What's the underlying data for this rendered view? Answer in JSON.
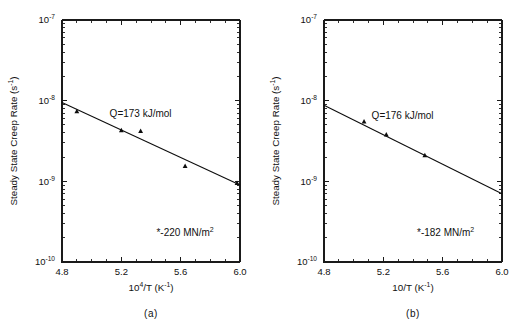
{
  "figure": {
    "panel_a_caption": "(a)",
    "panel_b_caption": "(b)"
  },
  "chart_data": [
    {
      "type": "scatter",
      "panel": "a",
      "caption": "(a)",
      "title": "",
      "xlabel_parts": {
        "base": "10",
        "exp": "4",
        "rest": "/T  (K",
        "rest_exp": "-1",
        "tail": ")"
      },
      "xlabel": "10^4/T (K^-1)",
      "ylabel": "Steady State Creep Rate (s^-1)",
      "ylabel_parts": {
        "text": "Steady State Creep Rate  (s",
        "exp": "-1",
        "tail": ")"
      },
      "xlim": [
        4.8,
        6.0
      ],
      "ylim": [
        1e-10,
        1e-07
      ],
      "yscale": "log",
      "xticks": [
        4.8,
        5.2,
        5.6,
        6.0
      ],
      "xticklabels": [
        "4.8",
        "5.2",
        "5.6",
        "6.0"
      ],
      "xminorticks": [
        4.9,
        5.0,
        5.1,
        5.3,
        5.4,
        5.5,
        5.7,
        5.8,
        5.9
      ],
      "yticks": [
        1e-10,
        1e-09,
        1e-08,
        1e-07
      ],
      "yticklabels": [
        "10-10",
        "10-9",
        "10-8",
        "10-7"
      ],
      "ytick_mantissa": "10",
      "ytick_exponents": [
        "-10",
        "-9",
        "-8",
        "-7"
      ],
      "grid": false,
      "legend": null,
      "annotations": [
        {
          "name": "activation-energy",
          "text": "Q=173  kJ/mol",
          "x": 5.33,
          "y": 6.2e-09
        },
        {
          "name": "stress-level",
          "text": "*-220  MN/m",
          "sup": "2",
          "x": 5.63,
          "y": 2.1e-10
        }
      ],
      "series": [
        {
          "name": "creep-data-220MPa",
          "marker": "filled-triangle",
          "x": [
            4.9,
            5.2,
            5.33,
            5.63,
            5.98
          ],
          "y": [
            7.4e-09,
            4.3e-09,
            4.2e-09,
            1.55e-09,
            9.5e-10
          ]
        }
      ],
      "fit": {
        "name": "arrhenius-fit",
        "x": [
          4.8,
          6.0
        ],
        "y": [
          9.5e-09,
          9e-10
        ],
        "activation_energy_kJ_per_mol": 173
      }
    },
    {
      "type": "scatter",
      "panel": "b",
      "caption": "(b)",
      "title": "",
      "xlabel_parts": {
        "base": "10",
        "exp": "",
        "rest": "/T  (K",
        "rest_exp": "-1",
        "tail": ")"
      },
      "xlabel": "10/T (K^-1)",
      "ylabel": "Steady State Creep Rate (s^-1)",
      "ylabel_parts": {
        "text": "Steady State Creep Rate  (s",
        "exp": "-1",
        "tail": ")"
      },
      "xlim": [
        4.8,
        6.0
      ],
      "ylim": [
        1e-10,
        1e-07
      ],
      "yscale": "log",
      "xticks": [
        4.8,
        5.2,
        5.6,
        6.0
      ],
      "xticklabels": [
        "4.8",
        "5.2",
        "5.6",
        "6.0"
      ],
      "xminorticks": [
        4.9,
        5.0,
        5.1,
        5.3,
        5.4,
        5.5,
        5.7,
        5.8,
        5.9
      ],
      "yticks": [
        1e-10,
        1e-09,
        1e-08,
        1e-07
      ],
      "yticklabels": [
        "10-10",
        "10-9",
        "10-8",
        "10-7"
      ],
      "ytick_mantissa": "10",
      "ytick_exponents": [
        "-10",
        "-9",
        "-8",
        "-7"
      ],
      "grid": false,
      "legend": null,
      "annotations": [
        {
          "name": "activation-energy",
          "text": "Q=176  kJ/mol",
          "x": 5.33,
          "y": 6e-09
        },
        {
          "name": "stress-level",
          "text": "*-182  MN/m",
          "sup": "2",
          "x": 5.62,
          "y": 2.1e-10
        }
      ],
      "series": [
        {
          "name": "creep-data-182MPa",
          "marker": "filled-triangle",
          "x": [
            5.07,
            5.22,
            5.48
          ],
          "y": [
            5.5e-09,
            3.8e-09,
            2.1e-09
          ]
        }
      ],
      "fit": {
        "name": "arrhenius-fit",
        "x": [
          4.8,
          6.0
        ],
        "y": [
          8.8e-09,
          7e-10
        ],
        "activation_energy_kJ_per_mol": 176
      }
    }
  ]
}
